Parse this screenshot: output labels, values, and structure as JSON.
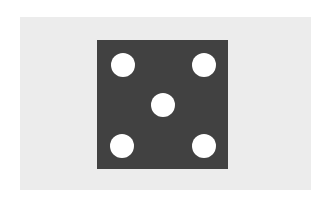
{
  "image": {
    "description": "Die face showing five pips on a light gray panel",
    "subject": "dice-five"
  },
  "die": {
    "face_value": 5,
    "pip_count": 5,
    "colors": {
      "face": "#414141",
      "pip": "#ffffff",
      "panel": "#ececec",
      "background": "#ffffff"
    },
    "pips": [
      {
        "position": "top-left",
        "cx": 123,
        "cy": 65
      },
      {
        "position": "top-right",
        "cx": 204,
        "cy": 65
      },
      {
        "position": "center",
        "cx": 163,
        "cy": 105
      },
      {
        "position": "bottom-left",
        "cx": 122,
        "cy": 146
      },
      {
        "position": "bottom-right",
        "cx": 204,
        "cy": 146
      }
    ]
  }
}
